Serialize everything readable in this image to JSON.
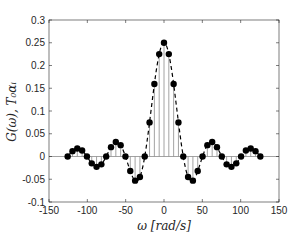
{
  "chart_data": {
    "type": "line",
    "title": "",
    "xlabel": "ω [rad/s]",
    "ylabel": "G(ω), T₀αᵢ",
    "xlim": [
      -150,
      150
    ],
    "ylim": [
      -0.1,
      0.3
    ],
    "xticks": [
      -150,
      -100,
      -50,
      0,
      50,
      100,
      150
    ],
    "yticks": [
      -0.1,
      -0.05,
      0,
      0.05,
      0.1,
      0.15,
      0.2,
      0.25,
      0.3
    ],
    "xtick_labels": [
      "-150",
      "-100",
      "-50",
      "0",
      "50",
      "100",
      "150"
    ],
    "ytick_labels": [
      "-0.1",
      "-0.05",
      "0",
      "0.05",
      "0.1",
      "0.15",
      "0.2",
      "0.25",
      "0.3"
    ],
    "grid": false,
    "legend": null,
    "series": [
      {
        "name": "G(ω) (continuous, dashed)",
        "style": "dashed-line",
        "description": "0.25·sinc(ω/(8π)), zeros at multiples of 8π"
      },
      {
        "name": "T₀αᵢ (discrete samples, stems with filled markers)",
        "style": "stem",
        "x": [
          -125.66,
          -119.38,
          -113.1,
          -106.81,
          -100.53,
          -94.25,
          -87.96,
          -81.68,
          -75.4,
          -69.12,
          -62.83,
          -56.55,
          -50.27,
          -43.98,
          -37.7,
          -31.42,
          -25.13,
          -18.85,
          -12.57,
          -6.28,
          0,
          6.28,
          12.57,
          18.85,
          25.13,
          31.42,
          37.7,
          43.98,
          50.27,
          56.55,
          62.83,
          69.12,
          75.4,
          81.68,
          87.96,
          94.25,
          100.53,
          106.81,
          113.1,
          119.38,
          125.66
        ],
        "values": [
          0.0,
          0.0118,
          0.0177,
          0.0132,
          0.0,
          -0.015,
          -0.0227,
          -0.0173,
          0.0,
          0.0205,
          0.0318,
          0.025,
          0.0,
          -0.032,
          -0.0531,
          -0.045,
          0.0,
          0.075,
          0.1592,
          0.2251,
          0.25,
          0.2251,
          0.1592,
          0.075,
          0.0,
          -0.045,
          -0.0531,
          -0.032,
          0.0,
          0.025,
          0.0318,
          0.0205,
          0.0,
          -0.0173,
          -0.0227,
          -0.015,
          0.0,
          0.0132,
          0.0177,
          0.0118,
          0.0
        ]
      }
    ]
  },
  "colors": {
    "axis": "#262626",
    "curve": "#000000",
    "stem": "#8c8c8c",
    "marker": "#000000",
    "zero_line": "#8c8c8c"
  }
}
